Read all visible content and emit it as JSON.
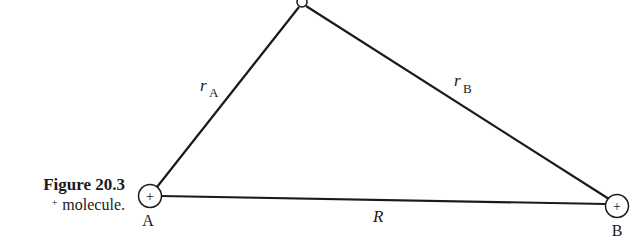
{
  "caption": {
    "label": "Figure 20.3",
    "text_prefix": "+",
    "text": "molecule."
  },
  "diagram": {
    "nuclei": [
      {
        "id": "A",
        "label": "A",
        "charge": "+"
      },
      {
        "id": "B",
        "label": "B",
        "charge": "+"
      }
    ],
    "electron_label": "",
    "distances": {
      "r_A": {
        "symbol": "r",
        "subscript": "A"
      },
      "r_B": {
        "symbol": "r",
        "subscript": "B"
      },
      "R": {
        "symbol": "R"
      }
    }
  }
}
